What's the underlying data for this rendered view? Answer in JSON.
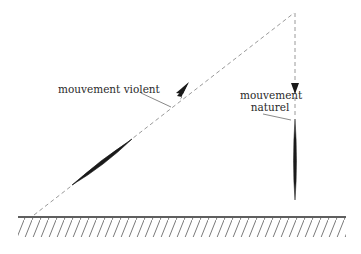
{
  "diagram": {
    "labels": {
      "violent": "mouvement violent",
      "naturel_line1": "mouvement",
      "naturel_line2": "naturel"
    },
    "elements": {
      "ground": "hatched-ground",
      "violent_path": "dashed-diagonal-path",
      "natural_path": "dashed-vertical-path",
      "projectile_violent": "lens-shaped-body-diagonal",
      "projectile_natural": "lens-shaped-body-vertical"
    },
    "colors": {
      "line": "#2a2a2a",
      "dash": "#9a9a9a",
      "hatch": "#6a6a6a",
      "background": "#ffffff"
    }
  }
}
